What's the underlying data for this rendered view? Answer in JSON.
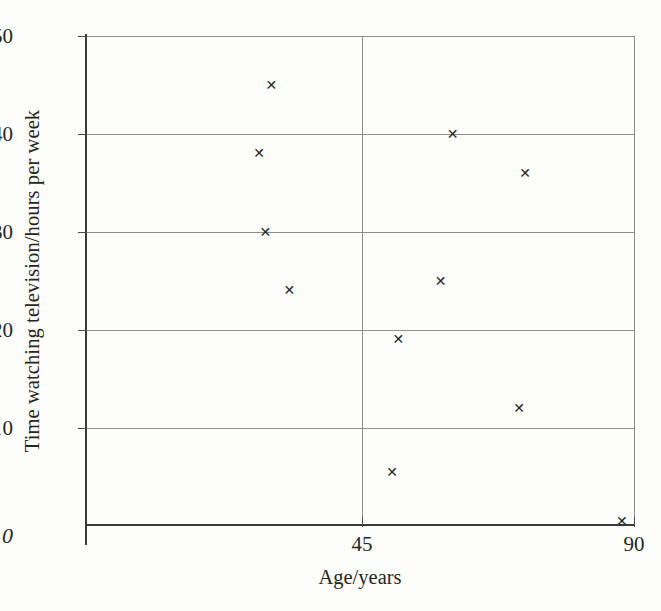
{
  "chart_data": {
    "type": "scatter",
    "title": "",
    "xlabel": "Age/years",
    "ylabel": "Time watching television/hours per week",
    "xlim": [
      0,
      90
    ],
    "ylim": [
      0,
      50
    ],
    "xticks": [
      {
        "value": 45,
        "label": "45"
      },
      {
        "value": 90,
        "label": "90"
      }
    ],
    "yticks": [
      {
        "value": 0,
        "label": "0"
      },
      {
        "value": 10,
        "label": "10"
      },
      {
        "value": 20,
        "label": "20"
      },
      {
        "value": 30,
        "label": "30"
      },
      {
        "value": 40,
        "label": "40"
      },
      {
        "value": 50,
        "label": "50"
      }
    ],
    "grid": {
      "horizontal": [
        10,
        20,
        30,
        40,
        50
      ],
      "vertical": [
        45
      ]
    },
    "legend": null,
    "marker": "x",
    "points": [
      {
        "x": 30,
        "y": 45
      },
      {
        "x": 28,
        "y": 38
      },
      {
        "x": 29,
        "y": 30
      },
      {
        "x": 33,
        "y": 24
      },
      {
        "x": 60,
        "y": 40
      },
      {
        "x": 58,
        "y": 25
      },
      {
        "x": 72,
        "y": 36
      },
      {
        "x": 51,
        "y": 19
      },
      {
        "x": 71,
        "y": 12
      },
      {
        "x": 50,
        "y": 5.5
      },
      {
        "x": 88,
        "y": 0.5
      }
    ],
    "marker_glyph": "✕",
    "axis_color": "#3a3a38",
    "grid_color": "#8d8d8d",
    "marker_color": "#262523"
  }
}
